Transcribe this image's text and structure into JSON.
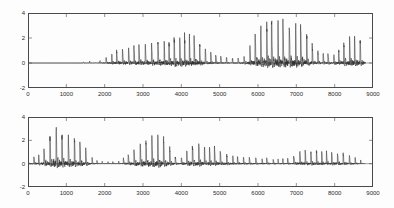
{
  "figure": {
    "background_color": "#fdfdfd",
    "axis_color": "#4a4a4a",
    "line_color": "#303030",
    "width": 394,
    "height": 208
  },
  "chart_data": [
    {
      "type": "line",
      "name": "upper-waveform",
      "title": "",
      "xlabel": "",
      "ylabel": "",
      "xlim": [
        0,
        9000
      ],
      "ylim": [
        -2,
        4
      ],
      "xticks": [
        0,
        1000,
        2000,
        3000,
        4000,
        5000,
        6000,
        7000,
        8000,
        9000
      ],
      "xticklabels": [
        "0",
        "1000",
        "2000",
        "3000",
        "4000",
        "5000",
        "6000",
        "7000",
        "8000",
        "9000"
      ],
      "yticks": [
        -2,
        0,
        2,
        4
      ],
      "yticklabels": [
        "-2",
        "0",
        "2",
        "4"
      ],
      "grid": false,
      "legend": null,
      "description": "Speech pressure waveform; silent until about sample 1450, brief low burst 1500-1680, voiced pulse train from about 1900 to 8800",
      "data_end_x": 8800,
      "envelope": [
        {
          "x": 0,
          "pos": 0.0,
          "neg": 0.0
        },
        {
          "x": 1400,
          "pos": 0.0,
          "neg": 0.0
        },
        {
          "x": 1470,
          "pos": 0.1,
          "neg": -0.1
        },
        {
          "x": 1560,
          "pos": 0.16,
          "neg": -0.16
        },
        {
          "x": 1660,
          "pos": 0.1,
          "neg": -0.1
        },
        {
          "x": 1760,
          "pos": 0.02,
          "neg": -0.02
        },
        {
          "x": 1900,
          "pos": 0.22,
          "neg": -0.2
        },
        {
          "x": 2050,
          "pos": 0.45,
          "neg": -0.35
        },
        {
          "x": 2200,
          "pos": 0.75,
          "neg": -0.5
        },
        {
          "x": 2400,
          "pos": 1.05,
          "neg": -0.62
        },
        {
          "x": 2700,
          "pos": 1.25,
          "neg": -0.7
        },
        {
          "x": 3000,
          "pos": 1.35,
          "neg": -0.75
        },
        {
          "x": 3300,
          "pos": 1.4,
          "neg": -0.8
        },
        {
          "x": 3600,
          "pos": 1.55,
          "neg": -0.95
        },
        {
          "x": 3800,
          "pos": 2.1,
          "neg": -1.15
        },
        {
          "x": 4000,
          "pos": 2.25,
          "neg": -1.25
        },
        {
          "x": 4200,
          "pos": 2.2,
          "neg": -1.25
        },
        {
          "x": 4400,
          "pos": 1.8,
          "neg": -1.05
        },
        {
          "x": 4600,
          "pos": 1.1,
          "neg": -0.7
        },
        {
          "x": 4800,
          "pos": 0.7,
          "neg": -0.45
        },
        {
          "x": 5000,
          "pos": 0.5,
          "neg": -0.35
        },
        {
          "x": 5200,
          "pos": 0.4,
          "neg": -0.3
        },
        {
          "x": 5450,
          "pos": 0.35,
          "neg": -0.28
        },
        {
          "x": 5650,
          "pos": 0.55,
          "neg": -0.45
        },
        {
          "x": 5850,
          "pos": 1.7,
          "neg": -0.95
        },
        {
          "x": 6000,
          "pos": 2.6,
          "neg": -1.25
        },
        {
          "x": 6200,
          "pos": 2.95,
          "neg": -1.35
        },
        {
          "x": 6450,
          "pos": 3.05,
          "neg": -1.35
        },
        {
          "x": 6700,
          "pos": 2.95,
          "neg": -1.35
        },
        {
          "x": 6950,
          "pos": 2.9,
          "neg": -1.35
        },
        {
          "x": 7150,
          "pos": 2.65,
          "neg": -1.3
        },
        {
          "x": 7300,
          "pos": 2.1,
          "neg": -1.1
        },
        {
          "x": 7450,
          "pos": 1.1,
          "neg": -0.7
        },
        {
          "x": 7600,
          "pos": 0.75,
          "neg": -0.55
        },
        {
          "x": 7800,
          "pos": 0.7,
          "neg": -0.55
        },
        {
          "x": 8000,
          "pos": 0.68,
          "neg": -0.55
        },
        {
          "x": 8150,
          "pos": 1.3,
          "neg": -0.8
        },
        {
          "x": 8300,
          "pos": 1.95,
          "neg": -0.95
        },
        {
          "x": 8500,
          "pos": 1.95,
          "neg": -0.95
        },
        {
          "x": 8700,
          "pos": 1.7,
          "neg": -0.9
        },
        {
          "x": 8800,
          "pos": 0.6,
          "neg": -0.4
        }
      ]
    },
    {
      "type": "line",
      "name": "lower-waveform",
      "title": "",
      "xlabel": "",
      "ylabel": "",
      "xlim": [
        0,
        9000
      ],
      "ylim": [
        -2,
        4
      ],
      "xticks": [
        0,
        1000,
        2000,
        3000,
        4000,
        5000,
        6000,
        7000,
        8000,
        9000
      ],
      "xticklabels": [
        "0",
        "1000",
        "2000",
        "3000",
        "4000",
        "5000",
        "6000",
        "7000",
        "8000",
        "9000"
      ],
      "yticks": [
        -2,
        0,
        2,
        4
      ],
      "yticklabels": [
        "-2",
        "0",
        "2",
        "4"
      ],
      "grid": false,
      "legend": null,
      "description": "Speech pressure waveform beginning at sample 0; strongest burst near 650-1000 reaching about 3.4, later bursts near 3000-3600 and 4200-4800, sparse low-level pulses after 5200",
      "data_end_x": 8800,
      "envelope": [
        {
          "x": 0,
          "pos": 0.15,
          "neg": -0.15
        },
        {
          "x": 120,
          "pos": 0.55,
          "neg": -0.55
        },
        {
          "x": 250,
          "pos": 0.6,
          "neg": -0.6
        },
        {
          "x": 400,
          "pos": 1.1,
          "neg": -0.85
        },
        {
          "x": 550,
          "pos": 1.9,
          "neg": -1.1
        },
        {
          "x": 680,
          "pos": 3.4,
          "neg": -1.45
        },
        {
          "x": 800,
          "pos": 2.75,
          "neg": -1.4
        },
        {
          "x": 950,
          "pos": 2.4,
          "neg": -1.35
        },
        {
          "x": 1100,
          "pos": 2.15,
          "neg": -1.3
        },
        {
          "x": 1250,
          "pos": 1.95,
          "neg": -1.25
        },
        {
          "x": 1400,
          "pos": 1.65,
          "neg": -1.1
        },
        {
          "x": 1550,
          "pos": 1.05,
          "neg": -0.8
        },
        {
          "x": 1700,
          "pos": 0.35,
          "neg": -0.3
        },
        {
          "x": 1900,
          "pos": 0.18,
          "neg": -0.15
        },
        {
          "x": 2150,
          "pos": 0.16,
          "neg": -0.14
        },
        {
          "x": 2400,
          "pos": 0.22,
          "neg": -0.18
        },
        {
          "x": 2600,
          "pos": 0.7,
          "neg": -0.55
        },
        {
          "x": 2800,
          "pos": 1.3,
          "neg": -0.9
        },
        {
          "x": 3000,
          "pos": 1.75,
          "neg": -1.1
        },
        {
          "x": 3200,
          "pos": 2.05,
          "neg": -1.25
        },
        {
          "x": 3400,
          "pos": 2.3,
          "neg": -1.35
        },
        {
          "x": 3550,
          "pos": 2.05,
          "neg": -1.25
        },
        {
          "x": 3700,
          "pos": 1.2,
          "neg": -0.85
        },
        {
          "x": 3850,
          "pos": 0.55,
          "neg": -0.45
        },
        {
          "x": 4000,
          "pos": 0.5,
          "neg": -0.4
        },
        {
          "x": 4150,
          "pos": 1.1,
          "neg": -0.75
        },
        {
          "x": 4350,
          "pos": 1.7,
          "neg": -1.05
        },
        {
          "x": 4550,
          "pos": 1.7,
          "neg": -1.05
        },
        {
          "x": 4750,
          "pos": 1.45,
          "neg": -0.95
        },
        {
          "x": 4950,
          "pos": 1.15,
          "neg": -0.8
        },
        {
          "x": 5150,
          "pos": 0.85,
          "neg": -0.6
        },
        {
          "x": 5400,
          "pos": 0.6,
          "neg": -0.45
        },
        {
          "x": 5700,
          "pos": 0.5,
          "neg": -0.38
        },
        {
          "x": 6000,
          "pos": 0.45,
          "neg": -0.35
        },
        {
          "x": 6300,
          "pos": 0.4,
          "neg": -0.32
        },
        {
          "x": 6600,
          "pos": 0.38,
          "neg": -0.3
        },
        {
          "x": 6900,
          "pos": 0.45,
          "neg": -0.35
        },
        {
          "x": 7050,
          "pos": 1.0,
          "neg": -0.55
        },
        {
          "x": 7250,
          "pos": 1.05,
          "neg": -0.55
        },
        {
          "x": 7500,
          "pos": 1.0,
          "neg": -0.55
        },
        {
          "x": 7750,
          "pos": 0.95,
          "neg": -0.52
        },
        {
          "x": 8000,
          "pos": 0.95,
          "neg": -0.52
        },
        {
          "x": 8250,
          "pos": 0.85,
          "neg": -0.48
        },
        {
          "x": 8500,
          "pos": 0.55,
          "neg": -0.35
        },
        {
          "x": 8700,
          "pos": 0.25,
          "neg": -0.18
        },
        {
          "x": 8800,
          "pos": 0.1,
          "neg": -0.08
        }
      ]
    }
  ]
}
